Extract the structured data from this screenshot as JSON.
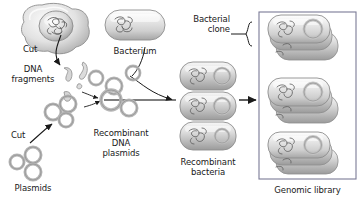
{
  "figure": {
    "background": "#ffffff",
    "width": 361,
    "height": 206
  },
  "labels": {
    "cut_nucleus": "Cut",
    "dna_fragments_line1": "DNA",
    "dna_fragments_line2": "fragments",
    "bacterium": "Bacterium",
    "cut_plasmid": "Cut",
    "plasmids": "Plasmids",
    "recombinant_plasmids_line1": "Recombinant",
    "recombinant_plasmids_line2": "DNA",
    "recombinant_plasmids_line3": "plasmids",
    "recombinant_bacteria_line1": "Recombinant",
    "recombinant_bacteria_line2": "bacteria",
    "bacterial_clone_line1": "Bacterial",
    "bacterial_clone_line2": "clone",
    "genomic_library": "Genomic library"
  },
  "colors": {
    "text": "#1a1a1a",
    "outline": "#7a7a7a",
    "arrow": "#1a1a1a",
    "cell_fill_light": "#f2f2f2",
    "cell_fill_mid": "#d8d8d8",
    "cell_fill_dark": "#b4b4b4",
    "box_border": "#6e6e8c",
    "dna_stroke": "#555555"
  },
  "elements": {
    "eukaryotic_cell": {
      "name": "eukaryotic-cell-with-nucleus",
      "count": 1
    },
    "dna_fragments": {
      "name": "dna-fragment-pieces",
      "count": 4
    },
    "bacterium": {
      "name": "bacterium-rod-cell",
      "count": 1
    },
    "plasmids": {
      "name": "plasmid-rings",
      "count": 3
    },
    "cut_plasmids": {
      "name": "cut-plasmid-rings",
      "count": 3
    },
    "recombinant_plasmids": {
      "name": "recombinant-plasmid-rings",
      "count": 5
    },
    "recombinant_bacteria": {
      "name": "recombinant-bacterium",
      "count": 3
    },
    "clone_clusters": {
      "name": "bacterial-clone-cluster",
      "count": 3
    },
    "arrows": {
      "name": "process-arrow",
      "count": 4
    }
  }
}
